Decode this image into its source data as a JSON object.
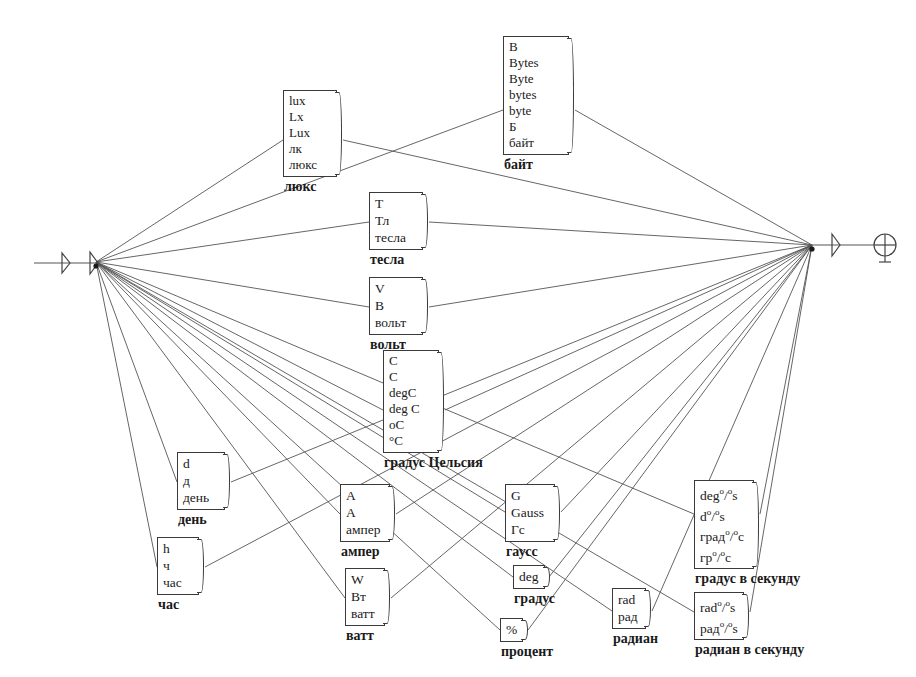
{
  "diagram": {
    "background": "#ffffff",
    "line_color": "#555555",
    "box_border": "#3a3a3a",
    "left_hub": {
      "x": 96,
      "y": 262
    },
    "right_hub": {
      "x": 812,
      "y": 245
    },
    "left_terminal": {
      "label": "left-terminal"
    },
    "right_terminal": {
      "label": "right-terminal"
    }
  },
  "nodes": [
    {
      "id": "lux",
      "x": 283,
      "y": 90,
      "w": 54,
      "aliases": [
        "lux",
        "Lx",
        "Lux",
        "лк",
        "люкс"
      ],
      "caption": "люкс",
      "anchor": {
        "x": 283,
        "y": 140
      },
      "anchor_right": {
        "x": 343,
        "y": 140
      }
    },
    {
      "id": "byte",
      "x": 503,
      "y": 36,
      "w": 66,
      "aliases": [
        "B",
        "Bytes",
        "Byte",
        "bytes",
        "byte",
        "Б",
        "байт"
      ],
      "caption": "байт",
      "anchor": {
        "x": 503,
        "y": 110
      },
      "anchor_right": {
        "x": 575,
        "y": 110
      }
    },
    {
      "id": "tesla",
      "x": 369,
      "y": 192,
      "w": 54,
      "aliases": [
        "T",
        "Тл",
        "тесла"
      ],
      "caption": "тесла",
      "anchor": {
        "x": 369,
        "y": 222
      },
      "anchor_right": {
        "x": 429,
        "y": 222
      }
    },
    {
      "id": "volt",
      "x": 369,
      "y": 277,
      "w": 54,
      "aliases": [
        "V",
        "В",
        "вольт"
      ],
      "caption": "вольт",
      "anchor": {
        "x": 369,
        "y": 307
      },
      "anchor_right": {
        "x": 429,
        "y": 307
      }
    },
    {
      "id": "celsius",
      "x": 383,
      "y": 350,
      "w": 56,
      "aliases": [
        "C",
        "С",
        "degC",
        "deg C",
        "oC",
        "°C"
      ],
      "caption": "градус Цельсия",
      "anchor": {
        "x": 383,
        "y": 410
      },
      "anchor_right": {
        "x": 445,
        "y": 410
      }
    },
    {
      "id": "day",
      "x": 177,
      "y": 452,
      "w": 48,
      "aliases": [
        "d",
        "д",
        "день"
      ],
      "caption": "день",
      "anchor": {
        "x": 177,
        "y": 482
      },
      "anchor_right": {
        "x": 231,
        "y": 482
      }
    },
    {
      "id": "hour",
      "x": 157,
      "y": 537,
      "w": 42,
      "aliases": [
        "h",
        "ч",
        "час"
      ],
      "caption": "час",
      "anchor": {
        "x": 157,
        "y": 567
      },
      "anchor_right": {
        "x": 205,
        "y": 567
      }
    },
    {
      "id": "ampere",
      "x": 340,
      "y": 484,
      "w": 50,
      "aliases": [
        "A",
        "А",
        "ампер"
      ],
      "caption": "ампер",
      "anchor": {
        "x": 340,
        "y": 514
      },
      "anchor_right": {
        "x": 396,
        "y": 514
      }
    },
    {
      "id": "watt",
      "x": 345,
      "y": 568,
      "w": 40,
      "aliases": [
        "W",
        "Вт",
        "ватт"
      ],
      "caption": "ватт",
      "anchor": {
        "x": 345,
        "y": 598
      },
      "anchor_right": {
        "x": 391,
        "y": 598
      }
    },
    {
      "id": "gauss",
      "x": 505,
      "y": 484,
      "w": 50,
      "aliases": [
        "G",
        "Gauss",
        "Гс"
      ],
      "caption": "гаусс",
      "anchor": {
        "x": 505,
        "y": 512
      },
      "anchor_right": {
        "x": 561,
        "y": 512
      }
    },
    {
      "id": "degree",
      "x": 513,
      "y": 565,
      "w": 30,
      "aliases": [
        "deg"
      ],
      "caption": "градус",
      "anchor": {
        "x": 513,
        "y": 577
      },
      "anchor_right": {
        "x": 549,
        "y": 577
      }
    },
    {
      "id": "percent",
      "x": 500,
      "y": 618,
      "w": 22,
      "aliases": [
        "%"
      ],
      "caption": "процент",
      "anchor": {
        "x": 500,
        "y": 630
      },
      "anchor_right": {
        "x": 528,
        "y": 630
      }
    },
    {
      "id": "radian",
      "x": 612,
      "y": 588,
      "w": 34,
      "aliases": [
        "rad",
        "рад"
      ],
      "caption": "радиан",
      "anchor": {
        "x": 612,
        "y": 611
      },
      "anchor_right": {
        "x": 652,
        "y": 611
      }
    },
    {
      "id": "degree-per-second",
      "x": 694,
      "y": 480,
      "w": 60,
      "aliases": [
        "deg*/*s",
        "d*/*s",
        "град*/*с",
        "гр*/*с"
      ],
      "caption": "градус в секунду",
      "anchor": {
        "x": 694,
        "y": 514
      },
      "anchor_right": {
        "x": 760,
        "y": 514
      }
    },
    {
      "id": "radian-per-second",
      "x": 694,
      "y": 592,
      "w": 50,
      "aliases": [
        "rad*/*s",
        "рад*/*s"
      ],
      "caption": "радиан в секунду",
      "anchor": {
        "x": 694,
        "y": 612
      },
      "anchor_right": {
        "x": 750,
        "y": 612
      }
    }
  ],
  "edges_from_left_hub": [
    "lux",
    "byte",
    "tesla",
    "volt",
    "celsius",
    "day",
    "hour",
    "ampere",
    "watt",
    "gauss",
    "degree",
    "percent",
    "radian",
    "degree-per-second",
    "radian-per-second"
  ],
  "edges_to_right_hub": [
    "lux",
    "byte",
    "tesla",
    "volt",
    "celsius",
    "day",
    "hour",
    "ampere",
    "watt",
    "gauss",
    "degree",
    "percent",
    "radian",
    "degree-per-second",
    "radian-per-second"
  ]
}
